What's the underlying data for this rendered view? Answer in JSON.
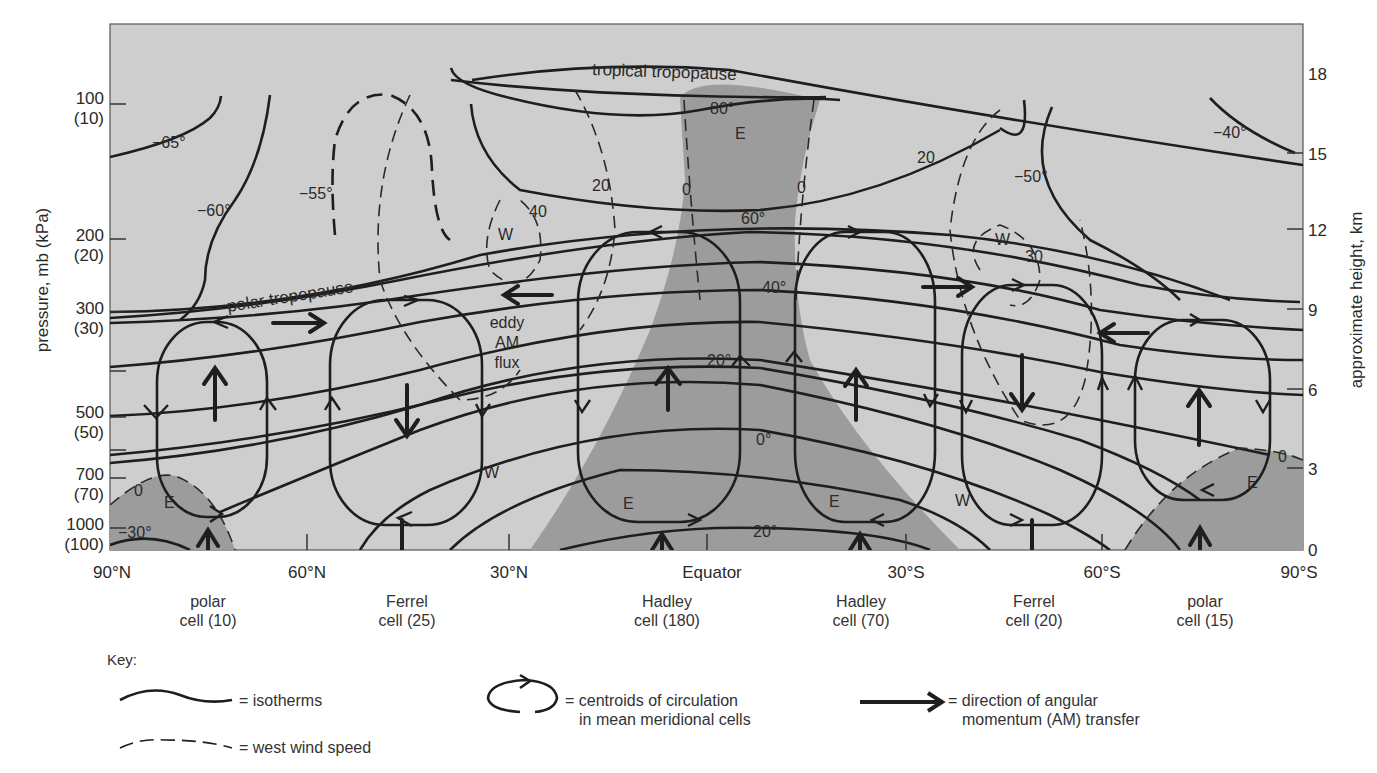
{
  "figure": {
    "left_axis": {
      "title": "pressure, mb (kPa)",
      "ticks": [
        {
          "mb": "100",
          "kpa": "(10)"
        },
        {
          "mb": "200",
          "kpa": "(20)"
        },
        {
          "mb": "300",
          "kpa": "(30)"
        },
        {
          "mb": "500",
          "kpa": "(50)"
        },
        {
          "mb": "700",
          "kpa": "(70)"
        },
        {
          "mb": "1000",
          "kpa": "(100)"
        }
      ]
    },
    "right_axis": {
      "title": "approximate height, km",
      "ticks": [
        "18",
        "15",
        "12",
        "9",
        "6",
        "3",
        "0"
      ]
    },
    "bottom_axis": {
      "ticks": [
        "90°N",
        "60°N",
        "30°N",
        "Equator",
        "30°S",
        "60°S",
        "90°S"
      ]
    },
    "annotations": {
      "tropical_tropopause": "tropical tropopause",
      "polar_tropopause": "polar tropopause",
      "eddy_line1": "eddy",
      "eddy_line2": "AM",
      "eddy_line3": "flux",
      "iso_m65": "−65°",
      "iso_m60": "−60°",
      "iso_m55": "−55°",
      "iso_m50": "−50°",
      "iso_m40": "−40°",
      "iso_80": "80°",
      "iso_60": "60°",
      "iso_40": "40°",
      "iso_20": "20°",
      "iso_0": "0°",
      "iso_20b": "20°",
      "iso_m30": "−30°",
      "wind_20a": "20",
      "wind_0a": "0",
      "wind_0b": "0",
      "wind_40": "40",
      "wind_20b": "20",
      "wind_30": "30",
      "wind_0_left": "0",
      "wind_0_right": "0",
      "east_top": "E",
      "east_nh_polar": "E",
      "east_nh_hadley": "E",
      "east_sh_hadley": "E",
      "east_sh_polar": "E",
      "west_nh_upper": "W",
      "west_nh_lower": "W",
      "west_sh_upper": "W",
      "west_sh_lower": "W"
    },
    "cells": [
      {
        "name": "polar",
        "line2": "cell (10)"
      },
      {
        "name": "Ferrel",
        "line2": "cell (25)"
      },
      {
        "name": "Hadley",
        "line2": "cell (180)"
      },
      {
        "name": "Hadley",
        "line2": "cell (70)"
      },
      {
        "name": "Ferrel",
        "line2": "cell (20)"
      },
      {
        "name": "polar",
        "line2": "cell (15)"
      }
    ]
  },
  "key": {
    "title": "Key:",
    "isotherms": "= isotherms",
    "west_wind": "= west wind speed",
    "centroids_line1": "= centroids of circulation",
    "centroids_line2": "in mean meridional cells",
    "am_line1": "= direction of angular",
    "am_line2": "momentum (AM) transfer"
  },
  "colors": {
    "background_plot": "#cfcfcf",
    "easterly_shade": "#9a9a9a",
    "line": "#1e1e1e"
  }
}
